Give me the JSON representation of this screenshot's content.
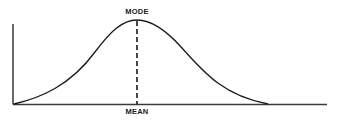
{
  "diagram": {
    "type": "normal-distribution-curve",
    "labels": {
      "top": "MODE",
      "bottom": "MEAN"
    },
    "colors": {
      "stroke": "#1a1a1a",
      "background": "#ffffff"
    }
  }
}
